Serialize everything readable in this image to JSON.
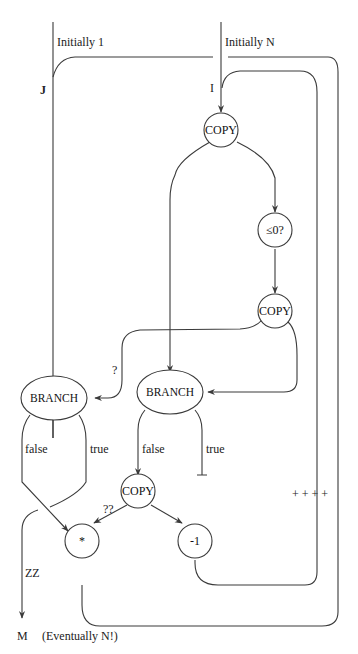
{
  "diagram": {
    "inputs": {
      "j_initial": "Initially 1",
      "i_initial": "Initially N",
      "j_var": "J",
      "i_var": "I"
    },
    "nodes": {
      "copy_top": "COPY",
      "le_zero": "≤0?",
      "copy_mid": "COPY",
      "branch_left": "BRANCH",
      "branch_right": "BRANCH",
      "copy_bottom": "COPY",
      "multiply": "*",
      "decrement": "-1"
    },
    "edge_labels": {
      "q1": "?",
      "q2": "??",
      "left_false": "false",
      "left_true": "true",
      "right_false": "false",
      "right_true": "true",
      "zz": "ZZ",
      "plus_marks": "+ + + +"
    },
    "output": {
      "var": "M",
      "note": "(Eventually N!)"
    }
  }
}
